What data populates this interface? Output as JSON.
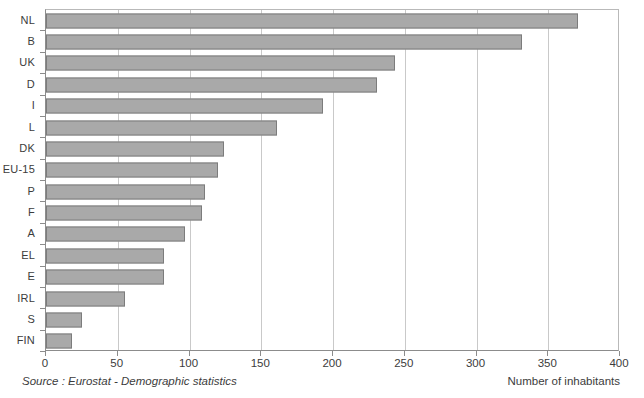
{
  "chart_data": {
    "type": "bar",
    "orientation": "horizontal",
    "title": "",
    "xlabel": "Number of inhabitants",
    "ylabel": "",
    "xlim": [
      0,
      400
    ],
    "xticks": [
      0,
      50,
      100,
      150,
      200,
      250,
      300,
      350,
      400
    ],
    "grid": true,
    "legend": false,
    "categories": [
      "NL",
      "B",
      "UK",
      "D",
      "I",
      "L",
      "DK",
      "EU-15",
      "P",
      "F",
      "A",
      "EL",
      "E",
      "IRL",
      "S",
      "FIN"
    ],
    "values": [
      371,
      332,
      243,
      231,
      193,
      161,
      124,
      120,
      111,
      109,
      97,
      82,
      82,
      55,
      25,
      18
    ],
    "series": [
      {
        "name": "Number of inhabitants",
        "values": [
          371,
          332,
          243,
          231,
          193,
          161,
          124,
          120,
          111,
          109,
          97,
          82,
          82,
          55,
          25,
          18
        ]
      }
    ],
    "source": "Source : Eurostat - Demographic statistics",
    "bar_color": "#a9a9a9",
    "bar_border_color": "#7c7c7c",
    "grid_color": "#c9c9c9",
    "axis_color": "#8c8c8c",
    "text_color": "#3c3c3c"
  },
  "footer": {
    "source": "Source : Eurostat - Demographic statistics",
    "caption": "Number of inhabitants"
  }
}
